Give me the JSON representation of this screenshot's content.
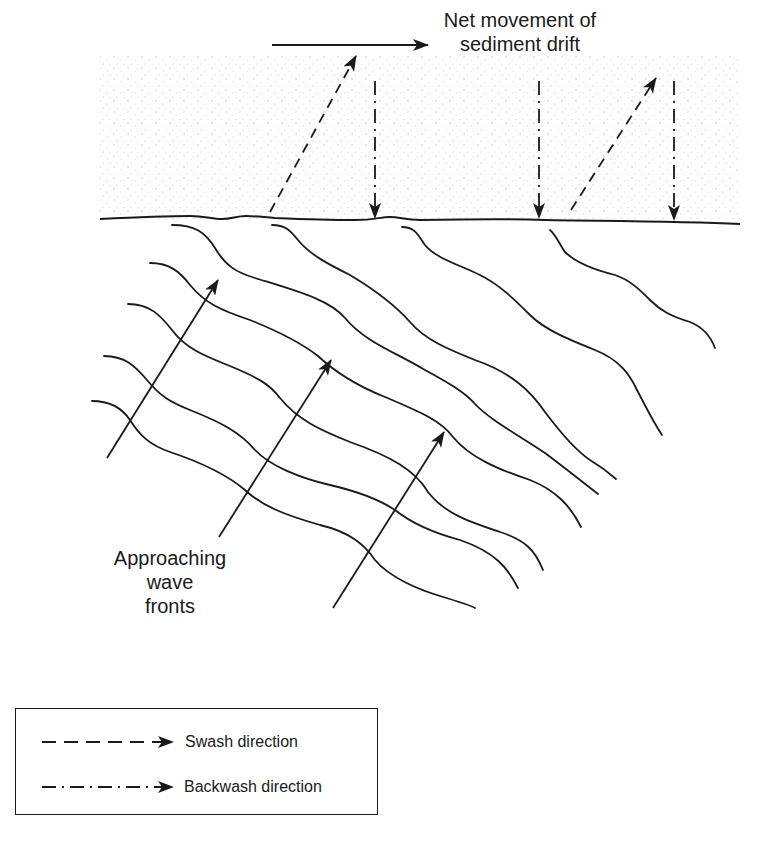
{
  "figure": {
    "title_label": {
      "line1": "Net movement of",
      "line2": "sediment drift"
    },
    "wave_label": {
      "line1": "Approaching",
      "line2": "wave",
      "line3": "fronts"
    },
    "colors": {
      "ink": "#1a1a1a",
      "sand_dot": "#b8b8b8",
      "background": "#ffffff"
    },
    "beach": {
      "region": {
        "x": 100,
        "y": 55,
        "width": 640,
        "height": 165
      }
    },
    "drift_arrow": {
      "x1": 272,
      "y1": 45,
      "x2": 428,
      "y2": 45
    },
    "shoreline_path": "M100,219 C140,217 170,216 190,216 C205,216 212,219 222,219 C232,219 236,216 246,216 C256,216 262,217 275,218 C300,219 330,220 355,220 C375,220 380,217 390,217 C400,217 405,220 420,220 C480,219 520,219 545,220 C600,221 680,221 740,224",
    "swash_arrows": [
      {
        "x1": 270,
        "y1": 212,
        "x2": 356,
        "y2": 56
      },
      {
        "x1": 571,
        "y1": 210,
        "x2": 656,
        "y2": 78
      }
    ],
    "backwash_arrows": [
      {
        "x1": 375,
        "y1": 81,
        "x2": 375,
        "y2": 218
      },
      {
        "x1": 539,
        "y1": 81,
        "x2": 539,
        "y2": 218
      },
      {
        "x1": 674,
        "y1": 81,
        "x2": 674,
        "y2": 220
      }
    ],
    "wave_fronts": [
      "M172,225 C195,225 205,232 215,248 C225,265 235,272 255,278 C300,292 330,300 345,318 C365,342 395,352 425,370 C450,384 465,392 475,404 C490,420 520,436 545,453 C565,468 580,480 598,494",
      "M150,263 C170,263 180,272 190,285 C205,303 220,310 250,320 C280,332 300,342 318,356 C335,372 355,385 385,397 C420,412 440,420 453,437 C470,458 500,470 530,480 C555,490 570,505 581,527",
      "M128,304 C150,304 160,315 172,330 C185,348 205,356 225,364 C260,378 270,385 280,398 C298,420 320,430 350,442 C390,456 415,470 428,492 C445,514 470,522 500,532 C525,540 535,550 543,570",
      "M104,356 C125,356 135,366 147,380 C160,396 170,402 190,410 C220,422 240,432 255,450 C270,466 300,478 330,485 C360,492 380,500 395,510 C410,522 430,532 460,540 C495,552 508,568 518,588",
      "M92,401 C110,401 122,408 130,420 C140,436 150,445 170,452 C200,462 225,473 245,490 C262,506 285,515 320,525 C350,532 365,545 375,560 C390,578 420,590 440,596 C460,602 470,605 475,608",
      "M272,225 C285,225 290,230 298,240 C310,255 330,265 350,275 C375,290 395,305 410,322 C425,340 450,350 475,360 C510,372 530,390 545,412 C560,432 575,450 590,460 C600,466 608,472 616,479",
      "M402,227 C415,227 418,235 425,245 C435,258 460,265 480,275 C500,285 515,300 530,315 C545,330 570,340 595,350 C620,360 630,375 637,390 C645,405 652,420 662,435",
      "M550,230 C556,235 560,245 565,252 C575,262 595,270 615,275 C630,280 640,290 650,300 C660,310 670,316 690,322 C705,328 712,340 715,348"
    ],
    "ray_arrows": [
      {
        "x1": 107,
        "y1": 458,
        "x2": 218,
        "y2": 280
      },
      {
        "x1": 219,
        "y1": 537,
        "x2": 331,
        "y2": 360
      },
      {
        "x1": 333,
        "y1": 608,
        "x2": 444,
        "y2": 432
      }
    ]
  },
  "legend": {
    "items": [
      {
        "label": "Swash direction",
        "style": "dashed"
      },
      {
        "label": "Backwash direction",
        "style": "dash-dot"
      }
    ]
  }
}
